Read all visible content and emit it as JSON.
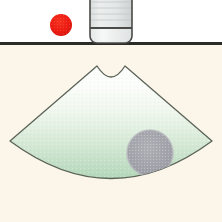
{
  "figure": {
    "title": "Ultrasound sector scan diagram",
    "width": 222,
    "height": 222,
    "upper_background_color": "#ffffff",
    "lower_background_color": "#fbf6e9"
  },
  "skin_line": {
    "label": "skin surface line",
    "color": "#2b2b28",
    "y": 43,
    "x_start": 0,
    "x_end": 222,
    "thickness": 3
  },
  "marker": {
    "label": "red marker dot",
    "color": "#ee1b11",
    "cx": 61,
    "cy": 25,
    "r": 11
  },
  "transducer": {
    "label": "ultrasound transducer probe",
    "body_color": "#e8eaea",
    "lower_color": "#f2f3f3",
    "outline_color": "#4a4a48",
    "x": 90,
    "y": -16,
    "width": 42,
    "height": 59,
    "corner_radius": 7,
    "divider_y": 28,
    "ridge_count": 6
  },
  "scan_field": {
    "label": "ultrasound sector scan field",
    "outline_color": "#5c6358",
    "fill_top_color": "#fdfefc",
    "fill_mid_color": "#eaf3e8",
    "fill_bottom_color": "#b8d9bc",
    "apex_left_x": 97,
    "apex_right_x": 125,
    "apex_y": 66,
    "concave_dip_y": 80,
    "corner_left_x": 10,
    "corner_left_y": 141,
    "corner_right_x": 212,
    "corner_right_y": 141,
    "bottom_arc_y": 201
  },
  "lesion": {
    "label": "gray circular lesion",
    "fill_color": "#a3a3ab",
    "edge_color": "#b4b4bb",
    "cx": 150,
    "cy": 153,
    "r": 23
  }
}
